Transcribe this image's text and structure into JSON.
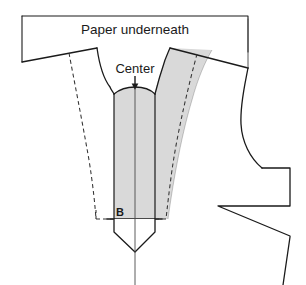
{
  "diagram": {
    "type": "sewing-pattern-drafting-diagram",
    "width": 306,
    "height": 285,
    "background_color": "#ffffff"
  },
  "labels": {
    "paper_underneath": "Paper underneath",
    "center": "Center",
    "point_b": "B"
  },
  "colors": {
    "shading": "#d9d9d9",
    "outline": "#1a1a1a",
    "dashed_line": "#333333",
    "label_text": "#1a1a1a",
    "background": "#ffffff"
  },
  "icons": {
    "center_arrow": "down-arrow-icon"
  },
  "geometry": {
    "paper_rect": {
      "top_left_x": 22,
      "top_y": 16,
      "right_x": 248,
      "left_bottom_y": 62
    },
    "center_line_x": 135,
    "b_line_y": 219,
    "strip_left_x": 114,
    "strip_right_x": 155,
    "point_bottom_y": 252
  },
  "annotations": [
    {
      "name": "paper-underneath-label",
      "text": "Paper underneath",
      "x": 135,
      "y": 29
    },
    {
      "name": "center-label",
      "text": "Center",
      "x": 135,
      "y": 71
    },
    {
      "name": "point-b-label",
      "text": "B",
      "x": 122,
      "y": 216
    }
  ]
}
